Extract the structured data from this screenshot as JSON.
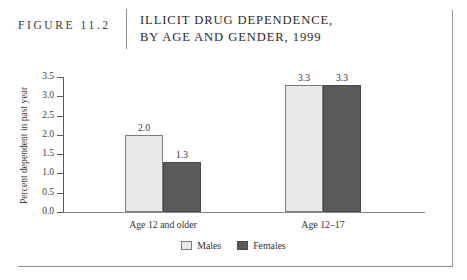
{
  "header": {
    "figure_number": "FIGURE 11.2",
    "title_line_1": "ILLICIT DRUG DEPENDENCE,",
    "title_line_2": "BY AGE AND GENDER, 1999"
  },
  "chart_data": {
    "type": "bar",
    "title": "ILLICIT DRUG DEPENDENCE, BY AGE AND GENDER, 1999",
    "xlabel": "",
    "ylabel": "Percent dependent in past year",
    "categories": [
      "Age 12 and older",
      "Age 12–17"
    ],
    "series": [
      {
        "name": "Males",
        "values": [
          2.0,
          3.3
        ],
        "labels": [
          "2.0",
          "3.3"
        ],
        "color": "#e9e9e9"
      },
      {
        "name": "Females",
        "values": [
          1.3,
          3.3
        ],
        "labels": [
          "1.3",
          "3.3"
        ],
        "color": "#5a5a5a"
      }
    ],
    "ylim": [
      0.0,
      3.5
    ],
    "ytick_labels": [
      "0.0",
      "0.5",
      "1.0",
      "1.5",
      "2.0",
      "2.5",
      "3.0",
      "3.5"
    ],
    "ytick_values": [
      0.0,
      0.5,
      1.0,
      1.5,
      2.0,
      2.5,
      3.0,
      3.5
    ],
    "grid": false,
    "legend_position": "bottom-center",
    "legend_entries": [
      "Males",
      "Females"
    ]
  }
}
